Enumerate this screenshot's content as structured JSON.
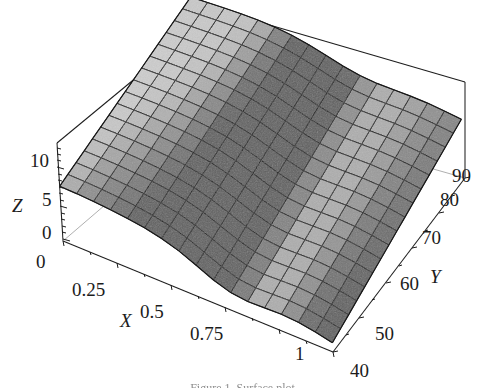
{
  "figure": {
    "title": "",
    "caption_partial": "Figure 1. Surface plot"
  },
  "chart_data": {
    "type": "surface",
    "title": "",
    "xlabel": "X",
    "ylabel": "Y",
    "zlabel": "Z",
    "xlim": [
      0,
      1
    ],
    "ylim": [
      40,
      90
    ],
    "zlim": [
      0,
      10
    ],
    "xticks": [
      "0",
      "0.25",
      "0.5",
      "0.75",
      "1"
    ],
    "xtick_values": [
      0,
      0.25,
      0.5,
      0.75,
      1
    ],
    "yticks": [
      "40",
      "50",
      "60",
      "70",
      "80",
      "90"
    ],
    "ytick_values": [
      40,
      50,
      60,
      70,
      80,
      90
    ],
    "zticks": [
      "0",
      "5",
      "10"
    ],
    "ztick_values": [
      0,
      5,
      10
    ],
    "grid": true,
    "legend": "none",
    "mesh_rows": 16,
    "mesh_cols": 16,
    "shading": "grayscale",
    "surface_light": "#d2d2d2",
    "surface_mid": "#9c9c9c",
    "surface_dark": "#6e6e6e",
    "mesh_line_color": "#141414",
    "z_samples": {
      "x": [
        0,
        0.25,
        0.5,
        0.75,
        1
      ],
      "y": [
        40,
        50,
        60,
        70,
        80,
        90
      ],
      "z": [
        [
          5.6,
          5.7,
          5.9,
          6.2,
          6.6,
          7.0
        ],
        [
          4.9,
          5.2,
          5.6,
          6.1,
          6.6,
          7.1
        ],
        [
          3.6,
          4.2,
          4.9,
          5.7,
          6.4,
          7.0
        ],
        [
          2.2,
          3.0,
          4.0,
          5.0,
          5.9,
          6.7
        ],
        [
          1.2,
          2.1,
          3.2,
          4.3,
          5.4,
          6.3
        ]
      ]
    }
  },
  "axes": {
    "x": {
      "label": "X",
      "ticks": [
        {
          "text": "0",
          "x": 36,
          "y": 268
        },
        {
          "text": "0.25",
          "x": 72,
          "y": 296
        },
        {
          "text": "0.5",
          "x": 140,
          "y": 318
        },
        {
          "text": "0.75",
          "x": 190,
          "y": 340
        },
        {
          "text": "1",
          "x": 295,
          "y": 360
        }
      ],
      "title_pos": {
        "x": 120,
        "y": 327
      }
    },
    "y": {
      "label": "Y",
      "ticks": [
        {
          "text": "40",
          "x": 350,
          "y": 377
        },
        {
          "text": "50",
          "x": 375,
          "y": 340
        },
        {
          "text": "60",
          "x": 400,
          "y": 290
        },
        {
          "text": "70",
          "x": 422,
          "y": 244
        },
        {
          "text": "80",
          "x": 440,
          "y": 206
        },
        {
          "text": "90",
          "x": 452,
          "y": 182
        }
      ],
      "title_pos": {
        "x": 430,
        "y": 283
      }
    },
    "z": {
      "label": "Z",
      "ticks": [
        {
          "text": "0",
          "x": 42,
          "y": 239
        },
        {
          "text": "5",
          "x": 42,
          "y": 206
        },
        {
          "text": "10",
          "x": 30,
          "y": 167
        }
      ],
      "title_pos": {
        "x": 12,
        "y": 212
      }
    }
  }
}
